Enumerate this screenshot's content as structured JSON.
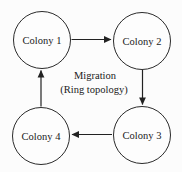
{
  "diagram": {
    "nodes": [
      {
        "id": "colony-1",
        "label": "Colony 1"
      },
      {
        "id": "colony-2",
        "label": "Colony 2"
      },
      {
        "id": "colony-3",
        "label": "Colony 3"
      },
      {
        "id": "colony-4",
        "label": "Colony 4"
      }
    ],
    "edges": [
      {
        "from": "colony-1",
        "to": "colony-2",
        "direction": "right"
      },
      {
        "from": "colony-2",
        "to": "colony-3",
        "direction": "down"
      },
      {
        "from": "colony-3",
        "to": "colony-4",
        "direction": "left"
      },
      {
        "from": "colony-4",
        "to": "colony-1",
        "direction": "up"
      }
    ],
    "caption": {
      "line1": "Migration",
      "line2": "(Ring topology)"
    },
    "colors": {
      "background": "#fcfcfc",
      "node_fill": "#fdfdfd",
      "stroke": "#2b2b2b",
      "text": "#1a1a1a"
    }
  }
}
